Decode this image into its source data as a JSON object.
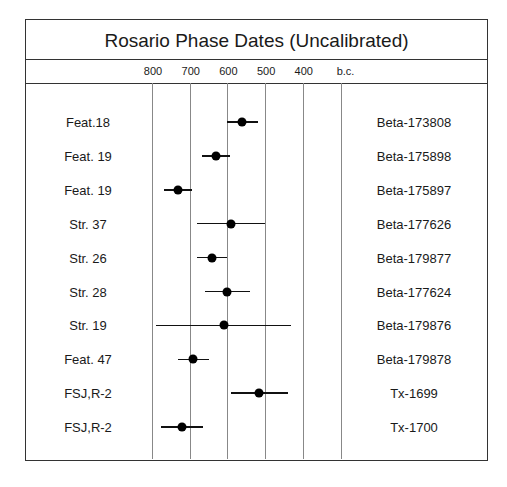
{
  "title": "Rosario Phase Dates (Uncalibrated)",
  "axis": {
    "ticks": [
      "800",
      "700",
      "600",
      "500",
      "400",
      "b.c."
    ],
    "tick_values": [
      800,
      700,
      600,
      500,
      400,
      300
    ]
  },
  "chart_data": {
    "type": "scatter",
    "title": "Rosario Phase Dates (Uncalibrated)",
    "xlabel": "b.c.",
    "ylabel": "",
    "xlim": [
      800,
      300
    ],
    "x_reversed": true,
    "grid": true,
    "legend": "none",
    "tick_labels": [
      "800",
      "700",
      "600",
      "500",
      "400",
      "b.c."
    ],
    "series": [
      {
        "name": "radiocarbon dates (point ± 1 sigma)",
        "rows": [
          {
            "context": "Feat.18",
            "lab_no": "Beta-173808",
            "date": 560,
            "err": 40
          },
          {
            "context": "Feat. 19",
            "lab_no": "Beta-175898",
            "date": 630,
            "err": 37
          },
          {
            "context": "Feat. 19",
            "lab_no": "Beta-175897",
            "date": 730,
            "err": 37
          },
          {
            "context": "Str. 37",
            "lab_no": "Beta-177626",
            "date": 590,
            "err": 90
          },
          {
            "context": "Str. 26",
            "lab_no": "Beta-179877",
            "date": 640,
            "err": 40
          },
          {
            "context": "Str. 28",
            "lab_no": "Beta-177624",
            "date": 600,
            "err": 60
          },
          {
            "context": "Str. 19",
            "lab_no": "Beta-179876",
            "date": 610,
            "err": 180
          },
          {
            "context": "Feat. 47",
            "lab_no": "Beta-179878",
            "date": 690,
            "err": 42
          },
          {
            "context": "FSJ,R-2",
            "lab_no": "Tx-1699",
            "date": 515,
            "err": 75
          },
          {
            "context": "FSJ,R-2",
            "lab_no": "Tx-1700",
            "date": 720,
            "err": 55
          }
        ]
      }
    ]
  }
}
